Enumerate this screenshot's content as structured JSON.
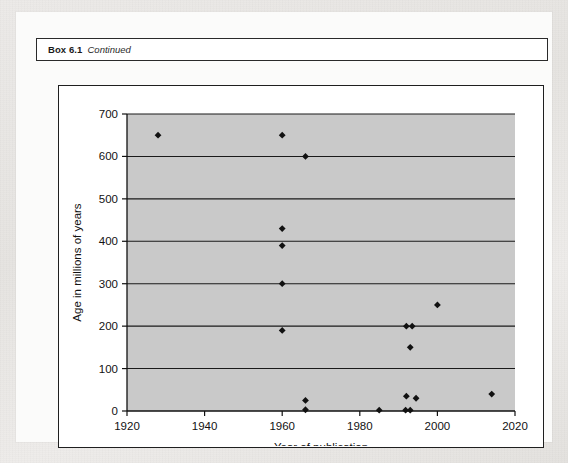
{
  "box": {
    "label": "Box 6.1",
    "continued": "Continued"
  },
  "chart_data": {
    "type": "scatter",
    "title": "",
    "xlabel": "Year of publication",
    "ylabel": "Age in millions of years",
    "xlim": [
      1920,
      2020
    ],
    "ylim": [
      0,
      700
    ],
    "xticks": [
      1920,
      1940,
      1960,
      1980,
      2000,
      2020
    ],
    "yticks": [
      0,
      100,
      200,
      300,
      400,
      500,
      600,
      700
    ],
    "grid": "horizontal",
    "legend": "none",
    "plot_background": "#c9c9c9",
    "marker_color": "#111111",
    "marker_shape": "diamond",
    "points": [
      {
        "x": 1928,
        "y": 650
      },
      {
        "x": 1960,
        "y": 650
      },
      {
        "x": 1966,
        "y": 600
      },
      {
        "x": 1960,
        "y": 430
      },
      {
        "x": 1960,
        "y": 390
      },
      {
        "x": 1960,
        "y": 300
      },
      {
        "x": 2000,
        "y": 250
      },
      {
        "x": 1992,
        "y": 200
      },
      {
        "x": 1993.5,
        "y": 200
      },
      {
        "x": 1960,
        "y": 190
      },
      {
        "x": 1993,
        "y": 150
      },
      {
        "x": 2014,
        "y": 40
      },
      {
        "x": 1992,
        "y": 35
      },
      {
        "x": 1994.5,
        "y": 30
      },
      {
        "x": 1966,
        "y": 25
      },
      {
        "x": 1966,
        "y": 3
      },
      {
        "x": 1985,
        "y": 2
      },
      {
        "x": 1991.8,
        "y": 2
      },
      {
        "x": 1993,
        "y": 2
      }
    ]
  }
}
